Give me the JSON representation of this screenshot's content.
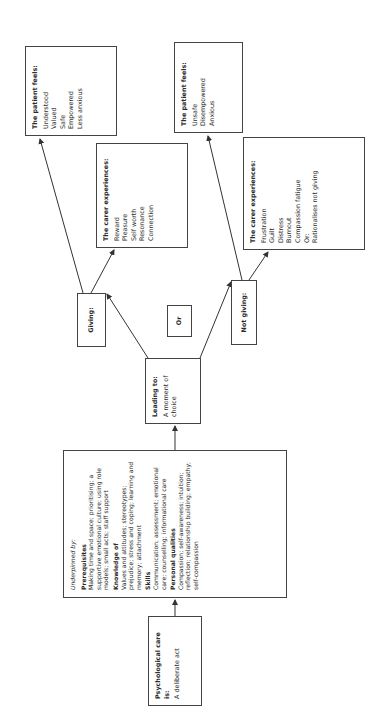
{
  "diagram": {
    "orientation": "rotated -90deg (reads bottom-to-top)",
    "start": {
      "title": "Psychological care is:",
      "body": "A deliberate act"
    },
    "underpinned": {
      "intro": "Underpinned by:",
      "sections": [
        {
          "heading": "Prerequisites",
          "text": "Making time and space; prioritising; a supportive emotional culture; using role models; small acts; staff support"
        },
        {
          "heading": "Knowledge of",
          "text": "Values and attitudes; stereotypes; prejudice; stress and coping; learning and memory; attachment"
        },
        {
          "heading": "Skills",
          "text": "Communication; assessment; emotional care; counselling; informational care"
        },
        {
          "heading": "Personal qualities",
          "text": "Compassion; self-awareness; intuition; reflection; relationship building; empathy; self-compassion"
        }
      ]
    },
    "leading": {
      "title": "Leading to:",
      "body": "A moment of choice"
    },
    "giving": {
      "label": "Giving:"
    },
    "or": {
      "label": "Or"
    },
    "not_giving": {
      "label": "Not giving:"
    },
    "giving_carer": {
      "title": "The carer experiences:",
      "items": [
        "Reward",
        "Pleasure",
        "Self worth",
        "Resonance",
        "Connection"
      ]
    },
    "giving_patient": {
      "title": "The patient feels:",
      "items": [
        "Understood",
        "Valued",
        "Safe",
        "Empowered",
        "Less anxious"
      ]
    },
    "not_giving_carer": {
      "title": "The carer experiences:",
      "items": [
        "Frustration",
        "Guilt",
        "Distress",
        "Burnout",
        "Compassion fatigue",
        "Or:",
        "Rationalises not giving"
      ]
    },
    "not_giving_patient": {
      "title": "The patient feels:",
      "items": [
        "Unsafe",
        "Disempowered",
        "Anxious"
      ]
    },
    "colors": {
      "border": "#444444",
      "text": "#2a2a2a",
      "background": "#ffffff"
    }
  }
}
